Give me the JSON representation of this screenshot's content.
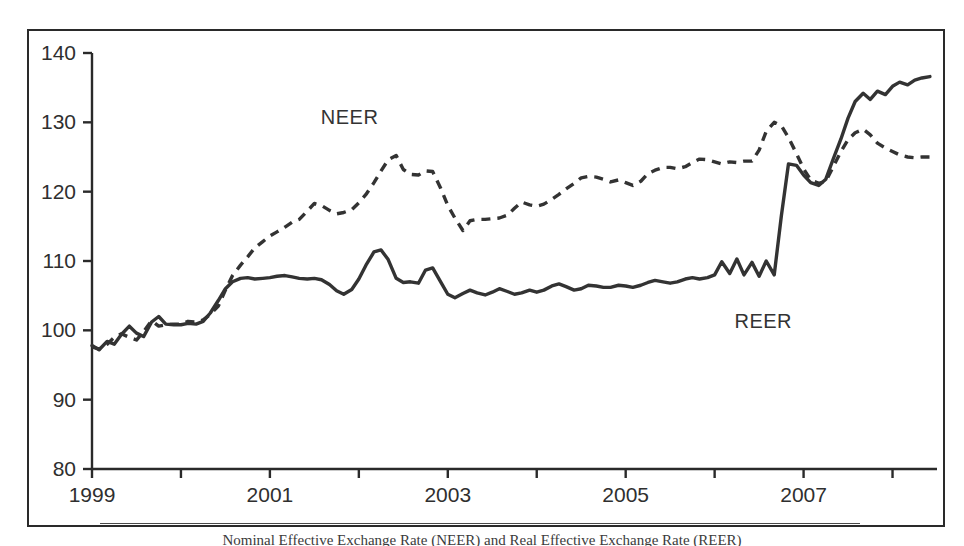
{
  "figure": {
    "caption": "Nominal Effective Exchange Rate (NEER) and Real Effective Exchange Rate (REER)"
  },
  "axes": {
    "y_ticks": [
      "140",
      "130",
      "120",
      "110",
      "100",
      "90",
      "80"
    ],
    "x_ticks": [
      "1999",
      "2001",
      "2003",
      "2005",
      "2007"
    ]
  },
  "series_labels": {
    "neer": "NEER",
    "reer": "REER"
  },
  "chart_data": {
    "type": "line",
    "title": "",
    "xlabel": "",
    "ylabel": "",
    "ylim": [
      80,
      140
    ],
    "xlim": [
      1999.0,
      2008.5
    ],
    "grid": false,
    "legend": "inline-annotations",
    "y_tick_values": [
      80,
      90,
      100,
      110,
      120,
      130,
      140
    ],
    "x_tick_values": [
      1999,
      2000,
      2001,
      2002,
      2003,
      2004,
      2005,
      2006,
      2007,
      2008
    ],
    "x_tick_labels_shown": [
      1999,
      2001,
      2003,
      2005,
      2007
    ],
    "series": [
      {
        "name": "NEER",
        "style": "dashed",
        "color": "#333333",
        "label_position": {
          "x": 2002.0,
          "y": 130.5
        },
        "x": [
          1999.0,
          1999.08,
          1999.17,
          1999.25,
          1999.33,
          1999.42,
          1999.5,
          1999.58,
          1999.67,
          1999.75,
          1999.83,
          1999.92,
          2000.0,
          2000.08,
          2000.17,
          2000.25,
          2000.33,
          2000.42,
          2000.5,
          2000.58,
          2000.67,
          2000.75,
          2000.83,
          2000.92,
          2001.0,
          2001.08,
          2001.17,
          2001.25,
          2001.33,
          2001.42,
          2001.5,
          2001.58,
          2001.67,
          2001.75,
          2001.83,
          2001.92,
          2002.0,
          2002.08,
          2002.17,
          2002.25,
          2002.33,
          2002.42,
          2002.5,
          2002.58,
          2002.67,
          2002.75,
          2002.83,
          2002.92,
          2003.0,
          2003.08,
          2003.17,
          2003.25,
          2003.33,
          2003.42,
          2003.5,
          2003.58,
          2003.67,
          2003.75,
          2003.83,
          2003.92,
          2004.0,
          2004.08,
          2004.17,
          2004.25,
          2004.33,
          2004.42,
          2004.5,
          2004.58,
          2004.67,
          2004.75,
          2004.83,
          2004.92,
          2005.0,
          2005.08,
          2005.17,
          2005.25,
          2005.33,
          2005.42,
          2005.5,
          2005.58,
          2005.67,
          2005.75,
          2005.83,
          2005.92,
          2006.0,
          2006.08,
          2006.17,
          2006.25,
          2006.33,
          2006.42,
          2006.5,
          2006.58,
          2006.67,
          2006.75,
          2006.83,
          2006.92,
          2007.0,
          2007.08,
          2007.17,
          2007.25,
          2007.33,
          2007.42,
          2007.5,
          2007.58,
          2007.67,
          2007.75,
          2007.83,
          2007.92,
          2008.0,
          2008.08,
          2008.17,
          2008.25,
          2008.33,
          2008.42
        ],
        "values": [
          97.6,
          97.3,
          98.0,
          99.0,
          99.5,
          99.0,
          98.6,
          99.8,
          101.4,
          100.6,
          100.8,
          100.9,
          100.9,
          101.3,
          101.2,
          101.5,
          102.3,
          103.5,
          105.8,
          107.9,
          109.4,
          110.6,
          111.9,
          112.8,
          113.6,
          114.2,
          114.9,
          115.6,
          116.0,
          117.2,
          118.3,
          118.0,
          117.3,
          116.8,
          117.0,
          117.4,
          118.4,
          119.6,
          121.3,
          123.0,
          124.6,
          125.2,
          123.2,
          122.5,
          122.4,
          123.0,
          122.9,
          120.5,
          118.0,
          116.2,
          114.4,
          115.8,
          116.0,
          116.0,
          116.1,
          116.2,
          116.6,
          117.6,
          118.5,
          118.1,
          117.9,
          118.2,
          118.9,
          119.6,
          120.4,
          121.2,
          122.0,
          122.2,
          122.1,
          121.8,
          121.4,
          121.7,
          121.3,
          120.9,
          121.5,
          122.6,
          123.1,
          123.5,
          123.5,
          123.3,
          123.6,
          124.2,
          124.7,
          124.6,
          124.3,
          124.0,
          124.3,
          124.2,
          124.4,
          124.4,
          126.0,
          128.7,
          130.0,
          129.5,
          127.8,
          125.5,
          123.3,
          121.7,
          121.2,
          121.5,
          123.5,
          125.8,
          127.5,
          128.5,
          129.0,
          128.2,
          127.0,
          126.3,
          125.8,
          125.3,
          125.0,
          124.9,
          125.0,
          125.0
        ]
      },
      {
        "name": "REER",
        "style": "solid",
        "color": "#333333",
        "label_position": {
          "x": 2006.65,
          "y": 101.0
        },
        "x": [
          1999.0,
          1999.08,
          1999.17,
          1999.25,
          1999.33,
          1999.42,
          1999.5,
          1999.58,
          1999.67,
          1999.75,
          1999.83,
          1999.92,
          2000.0,
          2000.08,
          2000.17,
          2000.25,
          2000.33,
          2000.42,
          2000.5,
          2000.58,
          2000.67,
          2000.75,
          2000.83,
          2000.92,
          2001.0,
          2001.08,
          2001.17,
          2001.25,
          2001.33,
          2001.42,
          2001.5,
          2001.58,
          2001.67,
          2001.75,
          2001.83,
          2001.92,
          2002.0,
          2002.08,
          2002.17,
          2002.25,
          2002.33,
          2002.42,
          2002.5,
          2002.58,
          2002.67,
          2002.75,
          2002.83,
          2002.92,
          2003.0,
          2003.08,
          2003.17,
          2003.25,
          2003.33,
          2003.42,
          2003.5,
          2003.58,
          2003.67,
          2003.75,
          2003.83,
          2003.92,
          2004.0,
          2004.08,
          2004.17,
          2004.25,
          2004.33,
          2004.42,
          2004.5,
          2004.58,
          2004.67,
          2004.75,
          2004.83,
          2004.92,
          2005.0,
          2005.08,
          2005.17,
          2005.25,
          2005.33,
          2005.42,
          2005.5,
          2005.58,
          2005.67,
          2005.75,
          2005.83,
          2005.92,
          2006.0,
          2006.08,
          2006.17,
          2006.25,
          2006.33,
          2006.42,
          2006.5,
          2006.58,
          2006.67,
          2006.75,
          2006.83,
          2006.92,
          2007.0,
          2007.08,
          2007.17,
          2007.25,
          2007.33,
          2007.42,
          2007.5,
          2007.58,
          2007.67,
          2007.75,
          2007.83,
          2007.92,
          2008.0,
          2008.08,
          2008.17,
          2008.25,
          2008.33,
          2008.42
        ],
        "values": [
          97.8,
          97.2,
          98.4,
          98.0,
          99.4,
          100.6,
          99.6,
          99.1,
          101.2,
          102.0,
          100.9,
          100.8,
          100.8,
          101.0,
          100.9,
          101.3,
          102.5,
          104.3,
          106.0,
          107.0,
          107.5,
          107.6,
          107.4,
          107.5,
          107.6,
          107.8,
          107.9,
          107.7,
          107.5,
          107.4,
          107.5,
          107.3,
          106.6,
          105.7,
          105.2,
          105.9,
          107.4,
          109.4,
          111.3,
          111.6,
          110.2,
          107.5,
          106.9,
          107.0,
          106.8,
          108.7,
          109.0,
          107.0,
          105.2,
          104.7,
          105.3,
          105.8,
          105.4,
          105.1,
          105.5,
          106.0,
          105.6,
          105.2,
          105.4,
          105.8,
          105.5,
          105.8,
          106.4,
          106.7,
          106.3,
          105.8,
          106.0,
          106.5,
          106.4,
          106.2,
          106.2,
          106.5,
          106.4,
          106.2,
          106.5,
          106.9,
          107.2,
          107.0,
          106.8,
          107.0,
          107.4,
          107.6,
          107.4,
          107.6,
          108.0,
          109.9,
          108.2,
          110.3,
          108.0,
          109.8,
          107.8,
          110.0,
          108.0,
          116.5,
          124.0,
          123.8,
          122.4,
          121.3,
          120.9,
          121.8,
          124.6,
          127.6,
          130.6,
          133.0,
          134.2,
          133.3,
          134.5,
          134.0,
          135.2,
          135.8,
          135.4,
          136.1,
          136.4,
          136.6
        ]
      }
    ]
  }
}
